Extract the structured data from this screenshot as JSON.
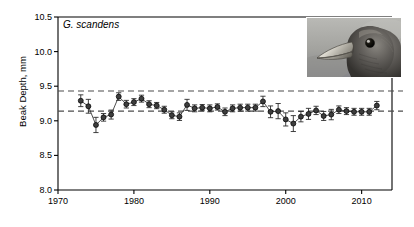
{
  "chart_data": {
    "type": "line",
    "title": "G. scandens",
    "xlabel": "",
    "ylabel": "Beak Depth, mm",
    "xlim": [
      1970,
      2014
    ],
    "ylim": [
      8.0,
      10.5
    ],
    "xticks": [
      1970,
      1980,
      1990,
      2000,
      2010
    ],
    "yticks": [
      8.0,
      8.5,
      9.0,
      9.5,
      10.0,
      10.5
    ],
    "ytick_labels": [
      "8.0",
      "8.5",
      "9.0",
      "9.5",
      "10.0",
      "10.5"
    ],
    "xtick_labels": [
      "1970",
      "1980",
      "1990",
      "2000",
      "2010"
    ],
    "grid": false,
    "legend": false,
    "marker": "filled-circle",
    "errorbars": true,
    "reference_lines": [
      {
        "name": "upper-dashed-reference",
        "y": 9.43,
        "style": "dashed"
      },
      {
        "name": "lower-dashed-reference",
        "y": 9.14,
        "style": "dashed"
      }
    ],
    "series": [
      {
        "name": "Beak depth mean",
        "x": [
          1973,
          1974,
          1975,
          1976,
          1977,
          1978,
          1979,
          1980,
          1981,
          1982,
          1983,
          1984,
          1985,
          1986,
          1987,
          1988,
          1989,
          1990,
          1991,
          1992,
          1993,
          1994,
          1995,
          1996,
          1997,
          1998,
          1999,
          2000,
          2001,
          2002,
          2003,
          2004,
          2005,
          2006,
          2007,
          2008,
          2009,
          2010,
          2011,
          2012
        ],
        "values": [
          9.29,
          9.21,
          8.94,
          9.05,
          9.09,
          9.35,
          9.24,
          9.27,
          9.32,
          9.24,
          9.22,
          9.16,
          9.08,
          9.06,
          9.23,
          9.18,
          9.19,
          9.18,
          9.2,
          9.13,
          9.18,
          9.19,
          9.19,
          9.19,
          9.28,
          9.13,
          9.14,
          9.02,
          8.96,
          9.06,
          9.1,
          9.15,
          9.07,
          9.09,
          9.16,
          9.14,
          9.13,
          9.13,
          9.13,
          9.22
        ],
        "errors": [
          0.085,
          0.1,
          0.11,
          0.055,
          0.065,
          0.055,
          0.055,
          0.05,
          0.05,
          0.05,
          0.045,
          0.05,
          0.05,
          0.055,
          0.08,
          0.05,
          0.045,
          0.05,
          0.045,
          0.055,
          0.05,
          0.05,
          0.05,
          0.05,
          0.075,
          0.085,
          0.11,
          0.095,
          0.115,
          0.075,
          0.08,
          0.06,
          0.065,
          0.075,
          0.055,
          0.05,
          0.05,
          0.05,
          0.05,
          0.06
        ]
      }
    ]
  },
  "inset": {
    "name": "finch-head-photograph",
    "caption": "G. scandens head photograph"
  }
}
